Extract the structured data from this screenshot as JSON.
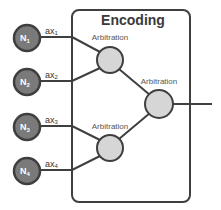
{
  "title": "Encoding",
  "colors": {
    "stroke": "#3f3f3f",
    "input_node_fill": "#7a7a7a",
    "arbitration_fill": "#d6d6d6",
    "box_fill": "#ffffff"
  },
  "inputs": [
    {
      "id": "N1",
      "label": "N",
      "subscript": "1",
      "edge_label": "ax",
      "edge_subscript": "1"
    },
    {
      "id": "N2",
      "label": "N",
      "subscript": "2",
      "edge_label": "ax",
      "edge_subscript": "2"
    },
    {
      "id": "N3",
      "label": "N",
      "subscript": "3",
      "edge_label": "ax",
      "edge_subscript": "3"
    },
    {
      "id": "N4",
      "label": "N",
      "subscript": "4",
      "edge_label": "ax",
      "edge_subscript": "4"
    }
  ],
  "arbitration_nodes": [
    {
      "id": "arb-top",
      "label": "Arbitration",
      "inputs": [
        "N1",
        "N2"
      ]
    },
    {
      "id": "arb-bottom",
      "label": "Arbitration",
      "inputs": [
        "N3",
        "N4"
      ]
    },
    {
      "id": "arb-final",
      "label": "Arbitration",
      "inputs": [
        "arb-top",
        "arb-bottom"
      ]
    }
  ],
  "output": {
    "from": "arb-final"
  }
}
